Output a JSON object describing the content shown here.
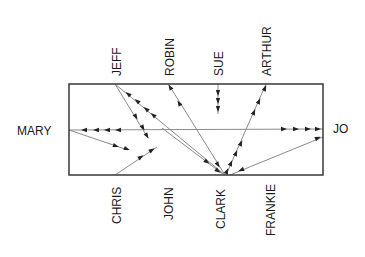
{
  "diagram": {
    "type": "sociogram",
    "frame": {
      "x": 69,
      "y": 84,
      "width": 254,
      "height": 91,
      "stroke": "#444444"
    },
    "line_color": "#8a8a8a",
    "arrow_color": "#222222",
    "nodes": [
      {
        "id": "jeff",
        "label": "JEFF",
        "x": 115,
        "y": 84,
        "side": "top"
      },
      {
        "id": "robin",
        "label": "ROBIN",
        "x": 169,
        "y": 84,
        "side": "top"
      },
      {
        "id": "sue",
        "label": "SUE",
        "x": 218,
        "y": 84,
        "side": "top"
      },
      {
        "id": "arthur",
        "label": "ARTHUR",
        "x": 266,
        "y": 84,
        "side": "top"
      },
      {
        "id": "mary",
        "label": "MARY",
        "x": 69,
        "y": 130,
        "side": "left"
      },
      {
        "id": "jo",
        "label": "JO",
        "x": 323,
        "y": 129,
        "side": "right"
      },
      {
        "id": "chris",
        "label": "CHRIS",
        "x": 115,
        "y": 175,
        "side": "bottom"
      },
      {
        "id": "john",
        "label": "JOHN",
        "x": 168,
        "y": 175,
        "side": "bottom"
      },
      {
        "id": "clark",
        "label": "CLARK",
        "x": 225,
        "y": 175,
        "side": "bottom"
      },
      {
        "id": "frankie",
        "label": "FRANKIE",
        "x": 274,
        "y": 175,
        "side": "bottom"
      }
    ],
    "edges": [
      {
        "from": "jo",
        "to": "mary",
        "x1": 323,
        "y1": 129,
        "x2": 69,
        "y2": 130,
        "arrows": [
          {
            "x": 84,
            "y": 130,
            "dir": "left"
          },
          {
            "x": 96,
            "y": 130,
            "dir": "left"
          },
          {
            "x": 107,
            "y": 130,
            "dir": "left"
          },
          {
            "x": 118,
            "y": 130,
            "dir": "left"
          },
          {
            "x": 284,
            "y": 129,
            "dir": "right"
          },
          {
            "x": 296,
            "y": 129,
            "dir": "right"
          },
          {
            "x": 308,
            "y": 129,
            "dir": "right"
          },
          {
            "x": 318,
            "y": 129,
            "dir": "right"
          }
        ]
      },
      {
        "from": "mary",
        "to": "john-side",
        "x1": 69,
        "y1": 130,
        "x2": 128,
        "y2": 150,
        "arrows": [
          {
            "x": 116,
            "y": 146,
            "dir": "dr"
          },
          {
            "x": 127,
            "y": 149,
            "dir": "dr"
          }
        ]
      },
      {
        "from": "chris",
        "to": "john-side",
        "x1": 115,
        "y1": 175,
        "x2": 157,
        "y2": 147,
        "arrows": [
          {
            "x": 141,
            "y": 157,
            "dir": "ur"
          },
          {
            "x": 152,
            "y": 150,
            "dir": "ur"
          }
        ]
      },
      {
        "from": "jeff",
        "to": "john",
        "x1": 115,
        "y1": 84,
        "x2": 148,
        "y2": 138,
        "arrows": [
          {
            "x": 136,
            "y": 117,
            "dir": "down"
          },
          {
            "x": 143,
            "y": 128,
            "dir": "down"
          },
          {
            "x": 147,
            "y": 136,
            "dir": "down"
          }
        ]
      },
      {
        "from": "clark",
        "to": "jeff",
        "x1": 225,
        "y1": 175,
        "x2": 115,
        "y2": 84,
        "arrows": [
          {
            "x": 128,
            "y": 94,
            "dir": "ul"
          },
          {
            "x": 137,
            "y": 101,
            "dir": "ul"
          },
          {
            "x": 146,
            "y": 109,
            "dir": "ul"
          },
          {
            "x": 153,
            "y": 115,
            "dir": "ul"
          }
        ]
      },
      {
        "from": "clark",
        "to": "robin",
        "x1": 225,
        "y1": 175,
        "x2": 169,
        "y2": 85,
        "arrows": [
          {
            "x": 170,
            "y": 87,
            "dir": "up"
          },
          {
            "x": 179,
            "y": 103,
            "dir": "up"
          },
          {
            "x": 218,
            "y": 165,
            "dir": "down"
          }
        ]
      },
      {
        "from": "sue",
        "to": "box",
        "x1": 218,
        "y1": 84,
        "x2": 218,
        "y2": 114,
        "arrows": [
          {
            "x": 218,
            "y": 93,
            "dir": "down"
          },
          {
            "x": 218,
            "y": 101,
            "dir": "down"
          },
          {
            "x": 218,
            "y": 109,
            "dir": "down"
          }
        ]
      },
      {
        "from": "clark",
        "to": "arthur",
        "x1": 226,
        "y1": 175,
        "x2": 266,
        "y2": 84,
        "arrows": [
          {
            "x": 265,
            "y": 88,
            "dir": "up"
          },
          {
            "x": 259,
            "y": 101,
            "dir": "up"
          },
          {
            "x": 254,
            "y": 112,
            "dir": "up"
          },
          {
            "x": 241,
            "y": 143,
            "dir": "up"
          },
          {
            "x": 236,
            "y": 153,
            "dir": "up"
          },
          {
            "x": 231,
            "y": 163,
            "dir": "up"
          },
          {
            "x": 227,
            "y": 171,
            "dir": "up"
          }
        ]
      },
      {
        "from": "frankie",
        "to": "jo",
        "x1": 230,
        "y1": 175,
        "x2": 323,
        "y2": 137,
        "arrows": [
          {
            "x": 318,
            "y": 138,
            "dir": "ur"
          },
          {
            "x": 241,
            "y": 170,
            "dir": "dl"
          }
        ]
      },
      {
        "from": "mary-side",
        "to": "clark",
        "x1": 162,
        "y1": 128,
        "x2": 224,
        "y2": 175,
        "arrows": [
          {
            "x": 207,
            "y": 162,
            "dir": "dr"
          },
          {
            "x": 218,
            "y": 171,
            "dir": "dr"
          }
        ]
      }
    ]
  }
}
